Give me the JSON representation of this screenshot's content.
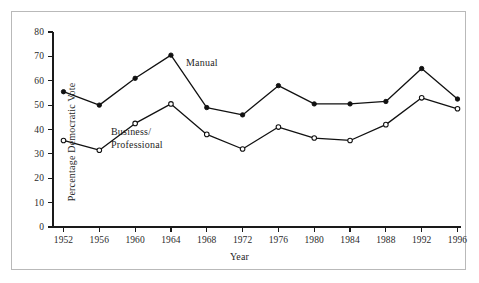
{
  "chart_data": {
    "type": "line",
    "title": "",
    "subtitle": "",
    "xlabel": "Year",
    "ylabel": "Percentage Democratic Vote",
    "x": [
      1952,
      1956,
      1960,
      1964,
      1968,
      1972,
      1976,
      1980,
      1984,
      1988,
      1992,
      1996
    ],
    "categories": [
      "1952",
      "1956",
      "1960",
      "1964",
      "1968",
      "1972",
      "1976",
      "1980",
      "1984",
      "1988",
      "1992",
      "1996"
    ],
    "xlim": [
      1952,
      1996
    ],
    "ylim": [
      0,
      80
    ],
    "ytick_values": [
      0,
      10,
      20,
      30,
      40,
      50,
      60,
      70,
      80
    ],
    "ytick_labels": [
      "0",
      "10",
      "20",
      "30",
      "40",
      "50",
      "60",
      "70",
      "80"
    ],
    "xtick_labels": [
      "1952",
      "1956",
      "1960",
      "1964",
      "1968",
      "1972",
      "1976",
      "1980",
      "1984",
      "1988",
      "1992",
      "1996"
    ],
    "grid": false,
    "legend_position": "inline-annotation",
    "series": [
      {
        "name": "Manual",
        "marker": "filled-circle",
        "values": [
          55.5,
          50.0,
          61.0,
          70.5,
          49.0,
          46.0,
          58.0,
          50.5,
          50.5,
          51.5,
          65.0,
          52.5
        ]
      },
      {
        "name": "Business/\nProfessional",
        "marker": "open-circle",
        "values": [
          35.5,
          31.5,
          42.5,
          50.5,
          38.0,
          32.0,
          41.0,
          36.5,
          35.5,
          42.0,
          53.0,
          48.5
        ]
      }
    ],
    "annotations": [
      {
        "text": "Manual",
        "x": 1968,
        "y": 64
      },
      {
        "text": "Business/\nProfessional",
        "x": 1959,
        "y": 34
      }
    ],
    "colors": {
      "line": "#111111",
      "axis": "#1a1a1a",
      "frame": "#b9b9b9",
      "background": "#ffffff",
      "marker_fill_filled": "#111111",
      "marker_fill_open": "#ffffff"
    }
  }
}
